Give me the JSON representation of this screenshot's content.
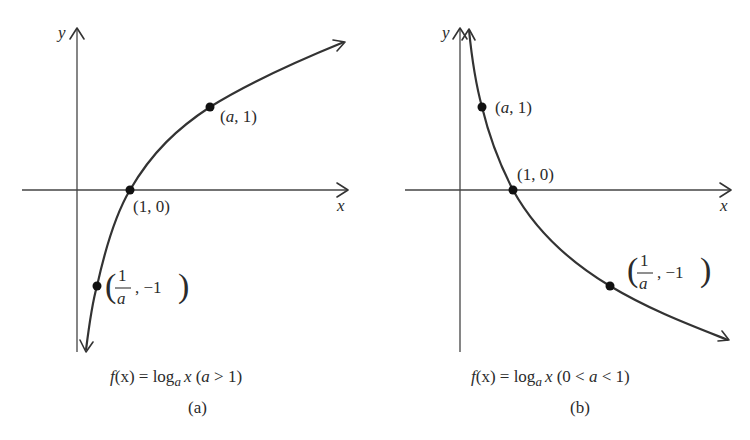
{
  "figure": {
    "panels": [
      {
        "id": "a",
        "axis_x_label": "x",
        "axis_y_label": "y",
        "points": [
          {
            "label_pre": "(",
            "label_var": "a",
            "label_post": ", 1)",
            "x": "a",
            "y": 1
          },
          {
            "label": "(1, 0)",
            "x": 1,
            "y": 0
          },
          {
            "label_num": "1",
            "label_den": "a",
            "label_tail": ", −1",
            "x": "1/a",
            "y": -1
          }
        ],
        "caption": {
          "f": "f",
          "x1": "(x) = log",
          "sub": "a",
          "x2": "x",
          "cond_open": " (",
          "cond_var": "a",
          "cond_rest": " > 1)"
        },
        "sublabel": "(a)"
      },
      {
        "id": "b",
        "axis_x_label": "x",
        "axis_y_label": "y",
        "points": [
          {
            "label_pre": "(",
            "label_var": "a",
            "label_post": ", 1)",
            "x": "a",
            "y": 1
          },
          {
            "label": "(1, 0)",
            "x": 1,
            "y": 0
          },
          {
            "label_num": "1",
            "label_den": "a",
            "label_tail": ", −1",
            "x": "1/a",
            "y": -1
          }
        ],
        "caption": {
          "f": "f",
          "x1": "(x) = log",
          "sub": "a",
          "x2": "x",
          "cond_open": " (0 < ",
          "cond_var": "a",
          "cond_rest": " < 1)"
        },
        "sublabel": "(b)"
      }
    ]
  }
}
